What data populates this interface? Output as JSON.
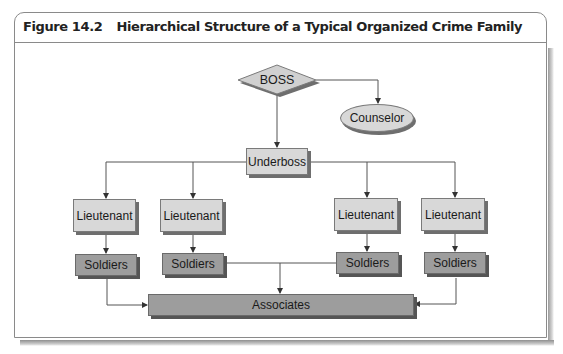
{
  "figure": {
    "number": "Figure 14.2",
    "title": "Hierarchical Structure of a Typical Organized Crime Family"
  },
  "diagram": {
    "type": "org-chart",
    "nodes": {
      "boss": {
        "label": "BOSS",
        "shape": "diamond"
      },
      "counselor": {
        "label": "Counselor",
        "shape": "ellipse"
      },
      "underboss": {
        "label": "Underboss",
        "shape": "rectangle"
      },
      "lieutenants": [
        {
          "label": "Lieutenant"
        },
        {
          "label": "Lieutenant"
        },
        {
          "label": "Lieutenant"
        },
        {
          "label": "Lieutenant"
        }
      ],
      "soldiers": [
        {
          "label": "Soldiers"
        },
        {
          "label": "Soldiers"
        },
        {
          "label": "Soldiers"
        },
        {
          "label": "Soldiers"
        }
      ],
      "associates": {
        "label": "Associates",
        "shape": "rectangle"
      }
    },
    "edges": [
      [
        "BOSS",
        "Counselor"
      ],
      [
        "BOSS",
        "Underboss"
      ],
      [
        "Underboss",
        "Lieutenant 1"
      ],
      [
        "Underboss",
        "Lieutenant 2"
      ],
      [
        "Underboss",
        "Lieutenant 3"
      ],
      [
        "Underboss",
        "Lieutenant 4"
      ],
      [
        "Lieutenant 1",
        "Soldiers 1"
      ],
      [
        "Lieutenant 2",
        "Soldiers 2"
      ],
      [
        "Lieutenant 3",
        "Soldiers 3"
      ],
      [
        "Lieutenant 4",
        "Soldiers 4"
      ],
      [
        "Soldiers 1",
        "Associates"
      ],
      [
        "Soldiers 2",
        "Associates"
      ],
      [
        "Soldiers 3",
        "Associates"
      ],
      [
        "Soldiers 4",
        "Associates"
      ]
    ],
    "colors": {
      "light_fill": "#d8d8d8",
      "dark_fill": "#9d9d9d",
      "line": "#555555"
    }
  }
}
